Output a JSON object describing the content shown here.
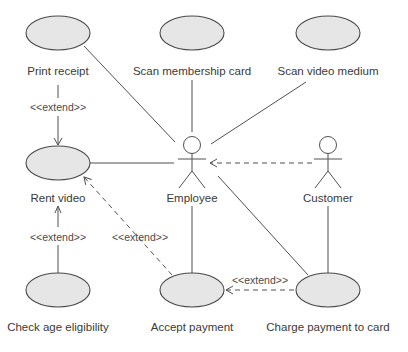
{
  "diagram": {
    "type": "UML use case diagram",
    "actors": [
      {
        "id": "employee",
        "label": "Employee"
      },
      {
        "id": "customer",
        "label": "Customer"
      }
    ],
    "use_cases": [
      {
        "id": "print_receipt",
        "label": "Print receipt"
      },
      {
        "id": "scan_membership_card",
        "label": "Scan membership card"
      },
      {
        "id": "scan_video_medium",
        "label": "Scan video medium"
      },
      {
        "id": "rent_video",
        "label": "Rent video"
      },
      {
        "id": "check_age_eligibility",
        "label": "Check age eligibility"
      },
      {
        "id": "accept_payment",
        "label": "Accept payment"
      },
      {
        "id": "charge_payment_to_card",
        "label": "Charge payment to card"
      }
    ],
    "relationships": [
      {
        "from": "employee",
        "to": "print_receipt",
        "type": "association"
      },
      {
        "from": "employee",
        "to": "scan_membership_card",
        "type": "association"
      },
      {
        "from": "employee",
        "to": "scan_video_medium",
        "type": "association"
      },
      {
        "from": "employee",
        "to": "rent_video",
        "type": "association"
      },
      {
        "from": "employee",
        "to": "accept_payment",
        "type": "association"
      },
      {
        "from": "employee",
        "to": "charge_payment_to_card",
        "type": "association"
      },
      {
        "from": "customer",
        "to": "employee",
        "type": "dependency"
      },
      {
        "from": "customer",
        "to": "charge_payment_to_card",
        "type": "association"
      },
      {
        "from": "print_receipt",
        "to": "rent_video",
        "type": "extend",
        "label": "<<extend>>"
      },
      {
        "from": "check_age_eligibility",
        "to": "rent_video",
        "type": "extend",
        "label": "<<extend>>"
      },
      {
        "from": "accept_payment",
        "to": "rent_video",
        "type": "extend",
        "label": "<<extend>>"
      },
      {
        "from": "charge_payment_to_card",
        "to": "accept_payment",
        "type": "extend",
        "label": "<<extend>>"
      }
    ],
    "extend_label": "<<extend>>"
  }
}
